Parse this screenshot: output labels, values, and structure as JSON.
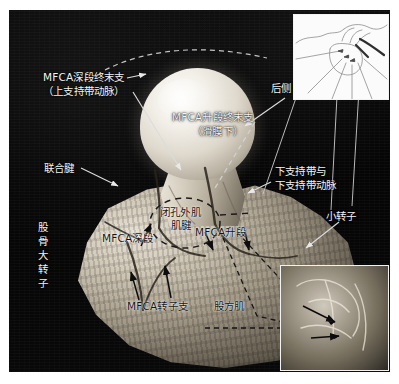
{
  "figure": {
    "kind": "anatomical-dissection-photograph",
    "background_color": "#050505",
    "label_color": "#f4f4f4",
    "inset_label_color": "#131313",
    "page_background": "#ffffff"
  },
  "labels": {
    "mfca_deep_terminal": "MFCA深段终末支",
    "mfca_deep_terminal_sub": "（上支持带动脉）",
    "mfca_ascending_terminal": "MFCA升段终末支",
    "mfca_ascending_terminal_sub": "（滑膜下）",
    "conjoint_tendon": "联合腱",
    "greater_trochanter": "股骨大转子",
    "obturator_externus_tendon_l1": "闭孔外肌",
    "obturator_externus_tendon_l2": "肌腱",
    "mfca_deep": "MFCA深段",
    "mfca_ascending": "MFCA升段",
    "mfca_trochanteric_branch": "MFCA转子支",
    "quadratus_femoris": "股方肌",
    "posterior_side": "后侧",
    "inferior_retinaculum_l1": "下支持带与",
    "inferior_retinaculum_l2": "下支持带动脉",
    "lesser_trochanter": "小转子"
  },
  "insets": {
    "schematic": {
      "name": "line-drawing schematic of hip vasculature",
      "position": "top-right"
    },
    "photo": {
      "name": "close-up dissection photograph",
      "position": "bottom-right"
    }
  }
}
